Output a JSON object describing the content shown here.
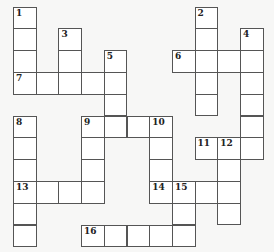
{
  "puzzle": {
    "type": "crossword",
    "rows": 11,
    "cols": 11,
    "origin": {
      "x": 13.5,
      "y": 7
    },
    "cell_w": 22.7,
    "cell_h": 21.8,
    "colors": {
      "background": "#f7f7f6",
      "cell": "#ffffff",
      "border": "#555555",
      "number": "#222222"
    },
    "cells": [
      {
        "r": 0,
        "c": 0,
        "n": "1"
      },
      {
        "r": 0,
        "c": 8,
        "n": "2"
      },
      {
        "r": 1,
        "c": 0
      },
      {
        "r": 1,
        "c": 2,
        "n": "3"
      },
      {
        "r": 1,
        "c": 8
      },
      {
        "r": 1,
        "c": 10,
        "n": "4"
      },
      {
        "r": 2,
        "c": 0
      },
      {
        "r": 2,
        "c": 2
      },
      {
        "r": 2,
        "c": 4,
        "n": "5"
      },
      {
        "r": 2,
        "c": 7,
        "n": "6"
      },
      {
        "r": 2,
        "c": 8
      },
      {
        "r": 2,
        "c": 9
      },
      {
        "r": 2,
        "c": 10
      },
      {
        "r": 3,
        "c": 0,
        "n": "7"
      },
      {
        "r": 3,
        "c": 1
      },
      {
        "r": 3,
        "c": 2
      },
      {
        "r": 3,
        "c": 3
      },
      {
        "r": 3,
        "c": 4
      },
      {
        "r": 3,
        "c": 8
      },
      {
        "r": 3,
        "c": 10
      },
      {
        "r": 4,
        "c": 4
      },
      {
        "r": 4,
        "c": 8
      },
      {
        "r": 4,
        "c": 10
      },
      {
        "r": 5,
        "c": 0,
        "n": "8"
      },
      {
        "r": 5,
        "c": 3,
        "n": "9"
      },
      {
        "r": 5,
        "c": 4
      },
      {
        "r": 5,
        "c": 5
      },
      {
        "r": 5,
        "c": 6,
        "n": "10"
      },
      {
        "r": 5,
        "c": 10
      },
      {
        "r": 6,
        "c": 0
      },
      {
        "r": 6,
        "c": 3
      },
      {
        "r": 6,
        "c": 6
      },
      {
        "r": 6,
        "c": 8,
        "n": "11"
      },
      {
        "r": 6,
        "c": 9,
        "n": "12"
      },
      {
        "r": 6,
        "c": 10
      },
      {
        "r": 7,
        "c": 0
      },
      {
        "r": 7,
        "c": 3
      },
      {
        "r": 7,
        "c": 6
      },
      {
        "r": 7,
        "c": 9
      },
      {
        "r": 8,
        "c": 0,
        "n": "13"
      },
      {
        "r": 8,
        "c": 1
      },
      {
        "r": 8,
        "c": 2
      },
      {
        "r": 8,
        "c": 3
      },
      {
        "r": 8,
        "c": 6,
        "n": "14"
      },
      {
        "r": 8,
        "c": 7,
        "n": "15"
      },
      {
        "r": 8,
        "c": 8
      },
      {
        "r": 8,
        "c": 9
      },
      {
        "r": 9,
        "c": 0
      },
      {
        "r": 9,
        "c": 7
      },
      {
        "r": 9,
        "c": 9
      },
      {
        "r": 10,
        "c": 0
      },
      {
        "r": 10,
        "c": 3,
        "n": "16"
      },
      {
        "r": 10,
        "c": 4
      },
      {
        "r": 10,
        "c": 5
      },
      {
        "r": 10,
        "c": 6
      },
      {
        "r": 10,
        "c": 7
      }
    ],
    "clue_numbers": [
      "1",
      "2",
      "3",
      "4",
      "5",
      "6",
      "7",
      "8",
      "9",
      "10",
      "11",
      "12",
      "13",
      "14",
      "15",
      "16"
    ]
  }
}
